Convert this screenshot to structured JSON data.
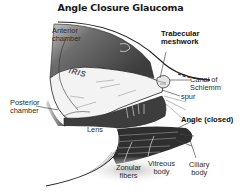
{
  "diagram": {
    "title": "Angle Closure Glaucoma",
    "style": "grayscale anatomical illustration",
    "colors": {
      "background": "#ffffff",
      "dark_tissue": "#3a3a3a",
      "mid_tissue": "#8a8a8a",
      "light_tissue": "#f2f2f2",
      "label_text": "#2b2b2b"
    },
    "labels": {
      "anterior_chamber": [
        "Anterior",
        "chamber"
      ],
      "trabecular_meshwork": [
        "Trabecular",
        "meshwork"
      ],
      "iris": "IRIS",
      "canal_of_schlemm": [
        "Canal of",
        "Schlemm"
      ],
      "spur": "spur",
      "posterior_chamber": [
        "Posterior",
        "chamber"
      ],
      "lens": "Lens",
      "angle": "Angle (closed)",
      "zonular_fibers": [
        "Zonular",
        "fibers"
      ],
      "vitreous_body": [
        "Vitreous",
        "body"
      ],
      "ciliary_body": [
        "Ciliary",
        "body"
      ]
    }
  }
}
